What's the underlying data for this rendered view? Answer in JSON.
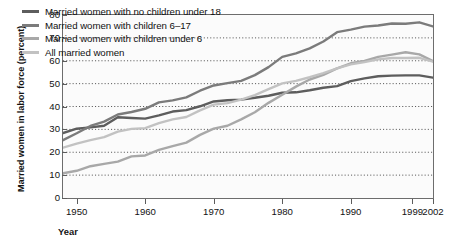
{
  "axes": {
    "ylabel": "Married women in labor force (percent)",
    "xlabel": "Year",
    "yticks": [
      "0",
      "10",
      "20",
      "30",
      "40",
      "50",
      "60",
      "70",
      "80"
    ],
    "xticks": [
      "1950",
      "1960",
      "1970",
      "1980",
      "1990",
      "1999",
      "2002"
    ]
  },
  "legend": [
    {
      "label": "Married women with no children under 18",
      "color": "#5d5d5d",
      "name": "legend-item-no-children-under-18"
    },
    {
      "label": "Married women with children 6–17",
      "color": "#7b7b7b",
      "name": "legend-item-children-6-17"
    },
    {
      "label": "Married women with children under 6",
      "color": "#a8a8a8",
      "name": "legend-item-children-under-6"
    },
    {
      "label": "All married women",
      "color": "#c2c2c2",
      "name": "legend-item-all-married-women"
    }
  ],
  "chart_data": {
    "type": "line",
    "title": "",
    "xlabel": "Year",
    "ylabel": "Married women in labor force (percent)",
    "xlim": [
      1948,
      2002
    ],
    "ylim": [
      0,
      80
    ],
    "grid": "horizontal-dotted",
    "legend_position": "top-left",
    "xticks": [
      1950,
      1960,
      1970,
      1980,
      1990,
      1999,
      2002
    ],
    "yticks": [
      0,
      10,
      20,
      30,
      40,
      50,
      60,
      70,
      80
    ],
    "series": [
      {
        "name": "Married women with no children under 18",
        "color": "#5d5d5d",
        "x": [
          1948,
          1950,
          1952,
          1954,
          1956,
          1958,
          1960,
          1962,
          1964,
          1966,
          1968,
          1970,
          1972,
          1974,
          1976,
          1978,
          1980,
          1982,
          1984,
          1986,
          1988,
          1990,
          1992,
          1994,
          1996,
          1998,
          2000,
          2002
        ],
        "values": [
          28.4,
          30.3,
          30.9,
          31.6,
          35.3,
          35.0,
          34.7,
          36.1,
          37.8,
          38.4,
          40.1,
          42.2,
          42.7,
          43.0,
          43.8,
          44.7,
          46.0,
          46.2,
          47.1,
          48.2,
          48.9,
          51.1,
          52.3,
          53.2,
          53.5,
          53.6,
          53.6,
          52.6
        ]
      },
      {
        "name": "Married women with children 6–17",
        "color": "#7b7b7b",
        "x": [
          1948,
          1950,
          1952,
          1954,
          1956,
          1958,
          1960,
          1962,
          1964,
          1966,
          1968,
          1970,
          1972,
          1974,
          1976,
          1978,
          1980,
          1982,
          1984,
          1986,
          1988,
          1990,
          1992,
          1994,
          1996,
          1998,
          2000,
          2002
        ],
        "values": [
          25.3,
          28.3,
          31.5,
          33.4,
          36.5,
          37.6,
          39.0,
          41.8,
          42.7,
          44.0,
          46.9,
          49.2,
          50.2,
          51.2,
          53.7,
          57.2,
          61.7,
          63.2,
          65.4,
          68.4,
          72.5,
          73.6,
          74.9,
          75.4,
          76.3,
          76.2,
          76.8,
          75.0
        ]
      },
      {
        "name": "Married women with children under 6",
        "color": "#a8a8a8",
        "x": [
          1948,
          1950,
          1952,
          1954,
          1956,
          1958,
          1960,
          1962,
          1964,
          1966,
          1968,
          1970,
          1972,
          1974,
          1976,
          1978,
          1980,
          1982,
          1984,
          1986,
          1988,
          1990,
          1992,
          1994,
          1996,
          1998,
          2000,
          2002
        ],
        "values": [
          10.8,
          11.9,
          13.9,
          14.9,
          15.9,
          18.2,
          18.6,
          21.0,
          22.7,
          24.2,
          27.6,
          30.3,
          31.6,
          34.4,
          37.5,
          41.6,
          45.1,
          48.7,
          51.8,
          53.8,
          56.7,
          58.9,
          59.9,
          61.7,
          62.7,
          63.7,
          62.8,
          59.8
        ]
      },
      {
        "name": "All married women",
        "color": "#c2c2c2",
        "x": [
          1948,
          1950,
          1952,
          1954,
          1956,
          1958,
          1960,
          1962,
          1964,
          1966,
          1968,
          1970,
          1972,
          1974,
          1976,
          1978,
          1980,
          1982,
          1984,
          1986,
          1988,
          1990,
          1992,
          1994,
          1996,
          1998,
          2000,
          2002
        ],
        "values": [
          22.0,
          23.8,
          25.3,
          26.6,
          29.0,
          30.2,
          30.5,
          32.7,
          34.4,
          35.4,
          38.3,
          40.8,
          41.5,
          43.0,
          45.0,
          47.6,
          50.1,
          51.2,
          52.8,
          54.6,
          56.7,
          58.4,
          59.4,
          60.6,
          61.2,
          61.2,
          61.3,
          59.6
        ]
      }
    ]
  }
}
